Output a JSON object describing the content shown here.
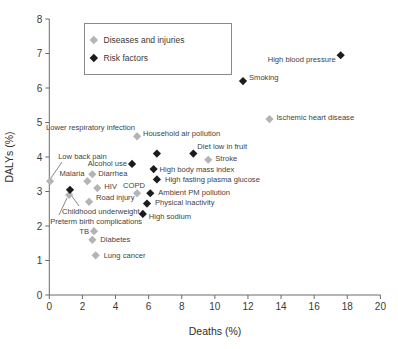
{
  "figure": {
    "width": 398,
    "height": 349,
    "background": "#ffffff"
  },
  "colors": {
    "disease_marker": "#b4b4b4",
    "risk_marker": "#1c1c1c",
    "axis_line": "#6b6b6b",
    "label_text": "#3f3f3f",
    "leader_line": "#7a7a7a"
  },
  "legend": {
    "items": [
      {
        "label": "Diseases and injuries",
        "type": "disease"
      },
      {
        "label": "Risk factors",
        "type": "risk"
      }
    ]
  },
  "chart_data": {
    "type": "scatter",
    "title": "",
    "xlabel": "Deaths (%)",
    "ylabel": "DALYs (%)",
    "xlim": [
      0,
      20
    ],
    "ylim": [
      0,
      8
    ],
    "xticks": [
      0,
      2,
      4,
      6,
      8,
      10,
      12,
      14,
      16,
      18,
      20
    ],
    "yticks": [
      0,
      1,
      2,
      3,
      4,
      5,
      6,
      7,
      8
    ],
    "grid": false,
    "legend_position": "upper-left",
    "series": [
      {
        "name": "Diseases and injuries",
        "color": "#b4b4b4",
        "points": [
          {
            "label": "Lower respiratory infection",
            "x": 5.3,
            "y": 4.6,
            "dx": -2,
            "dy": -9,
            "align": "end"
          },
          {
            "label": "Ischemic heart disease",
            "x": 13.3,
            "y": 5.1,
            "dx": 7,
            "dy": -2,
            "align": "start"
          },
          {
            "label": "Stroke",
            "x": 9.6,
            "y": 3.92,
            "dx": 7,
            "dy": -1,
            "align": "start"
          },
          {
            "label": "Diarrhea",
            "x": 2.6,
            "y": 3.5,
            "dx": 6,
            "dy": -1,
            "align": "start"
          },
          {
            "label": "Malaria",
            "x": 2.3,
            "y": 3.3,
            "dx": -3,
            "dy": -8,
            "align": "end"
          },
          {
            "label": "HIV",
            "x": 2.9,
            "y": 3.1,
            "dx": 7,
            "dy": -2,
            "align": "start"
          },
          {
            "label": "COPD",
            "x": 5.3,
            "y": 2.95,
            "dx": -3,
            "dy": -8,
            "align": "middle"
          },
          {
            "label": "Road injury",
            "x": 2.4,
            "y": 2.7,
            "dx": 7,
            "dy": -5,
            "align": "start"
          },
          {
            "label": "Low back pain",
            "x": 0.05,
            "y": 3.3,
            "dx": 8,
            "dy": -25,
            "align": "start",
            "leader": [
              62,
              162,
              51,
              178
            ]
          },
          {
            "label": "Preterm birth complications",
            "x": 1.2,
            "y": 2.9,
            "dx": -19,
            "dy": 26,
            "align": "start",
            "leader": [
              59,
              215,
              67,
              198
            ]
          },
          {
            "label": "TB",
            "x": 2.7,
            "y": 1.85,
            "dx": -5,
            "dy": 0,
            "align": "end"
          },
          {
            "label": "Diabetes",
            "x": 2.6,
            "y": 1.6,
            "dx": 8,
            "dy": 0,
            "align": "start"
          },
          {
            "label": "Lung cancer",
            "x": 2.8,
            "y": 1.15,
            "dx": 8,
            "dy": 0,
            "align": "start"
          }
        ]
      },
      {
        "name": "Risk factors",
        "color": "#1c1c1c",
        "points": [
          {
            "label": "High blood pressure",
            "x": 17.6,
            "y": 6.95,
            "dx": -5,
            "dy": 4,
            "align": "end"
          },
          {
            "label": "Smoking",
            "x": 11.7,
            "y": 6.2,
            "dx": 6,
            "dy": -4,
            "align": "start"
          },
          {
            "label": "Household air pollution",
            "x": 6.5,
            "y": 4.1,
            "dx": -14,
            "dy": -20,
            "align": "start"
          },
          {
            "label": "Diet low in fruit",
            "x": 8.7,
            "y": 4.1,
            "dx": 4,
            "dy": -7,
            "align": "start"
          },
          {
            "label": "High body mass index",
            "x": 6.3,
            "y": 3.65,
            "dx": 6,
            "dy": 0,
            "align": "start"
          },
          {
            "label": "High fasting plasma glucose",
            "x": 6.5,
            "y": 3.35,
            "dx": 8,
            "dy": 0,
            "align": "start"
          },
          {
            "label": "Alcohol use",
            "x": 5.0,
            "y": 3.8,
            "dx": -5,
            "dy": -1,
            "align": "end"
          },
          {
            "label": "Ambient PM pollution",
            "x": 6.1,
            "y": 2.95,
            "dx": 8,
            "dy": -1,
            "align": "start"
          },
          {
            "label": "Physical inactivity",
            "x": 5.9,
            "y": 2.65,
            "dx": 8,
            "dy": -1,
            "align": "start"
          },
          {
            "label": "High sodium",
            "x": 5.65,
            "y": 2.35,
            "dx": 6,
            "dy": 2,
            "align": "start"
          },
          {
            "label": "Childhood underweight",
            "x": 1.25,
            "y": 3.05,
            "dx": -8,
            "dy": 22,
            "align": "start",
            "leader": [
              79,
              206,
              71,
              195
            ]
          }
        ]
      }
    ]
  }
}
